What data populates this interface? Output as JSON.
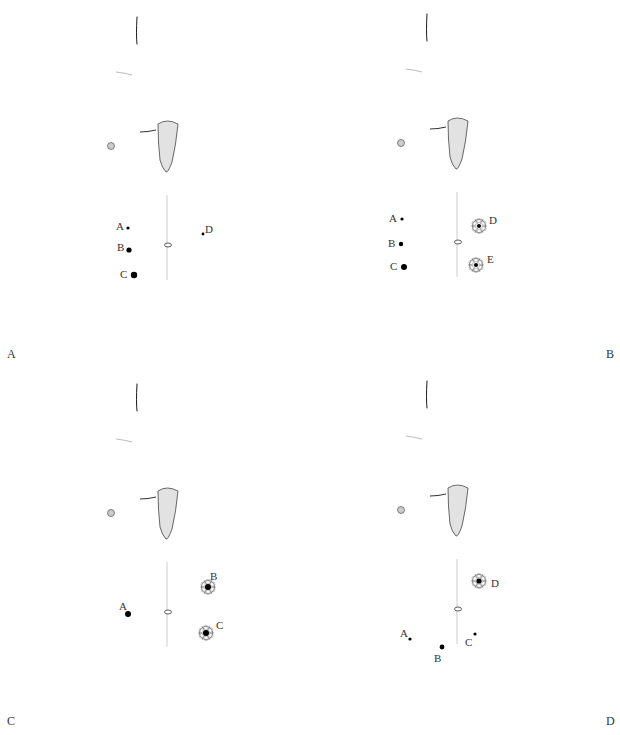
{
  "figure": {
    "panels": [
      {
        "id": "A",
        "letter": "A",
        "letter_pos": "left",
        "ports": [
          {
            "label": "A",
            "x": 128,
            "y": 228,
            "r": 1.6,
            "type": "dot",
            "label_dx": -12,
            "label_dy": -1
          },
          {
            "label": "B",
            "x": 129,
            "y": 250,
            "r": 2.6,
            "type": "dot",
            "label_dx": -12,
            "label_dy": -2
          },
          {
            "label": "C",
            "x": 134,
            "y": 275,
            "r": 3.2,
            "type": "dot",
            "label_dx": -14,
            "label_dy": 0
          },
          {
            "label": "D",
            "x": 203,
            "y": 234,
            "r": 1.4,
            "type": "dot",
            "label_dx": 2,
            "label_dy": -4
          }
        ]
      },
      {
        "id": "B",
        "letter": "B",
        "letter_pos": "right",
        "ports": [
          {
            "label": "A",
            "x": 112,
            "y": 222,
            "r": 1.6,
            "type": "dot",
            "label_dx": -13,
            "label_dy": 0
          },
          {
            "label": "B",
            "x": 111,
            "y": 247,
            "r": 2.2,
            "type": "dot",
            "label_dx": -13,
            "label_dy": 0
          },
          {
            "label": "C",
            "x": 114,
            "y": 270,
            "r": 3.0,
            "type": "dot",
            "label_dx": -14,
            "label_dy": 0
          },
          {
            "label": "D",
            "x": 189,
            "y": 229,
            "r": 2.0,
            "type": "rosette",
            "label_dx": 10,
            "label_dy": -5
          },
          {
            "label": "E",
            "x": 186,
            "y": 268,
            "r": 2.0,
            "type": "rosette",
            "label_dx": 11,
            "label_dy": -5
          }
        ]
      },
      {
        "id": "C",
        "letter": "C",
        "letter_pos": "left",
        "ports": [
          {
            "label": "A",
            "x": 128,
            "y": 247,
            "r": 3.0,
            "type": "dot",
            "label_dx": -9,
            "label_dy": -7
          },
          {
            "label": "B",
            "x": 208,
            "y": 220,
            "r": 3.0,
            "type": "rosette",
            "label_dx": 2,
            "label_dy": -10
          },
          {
            "label": "C",
            "x": 206,
            "y": 266,
            "r": 3.0,
            "type": "rosette",
            "label_dx": 10,
            "label_dy": -7
          }
        ]
      },
      {
        "id": "D",
        "letter": "D",
        "letter_pos": "right",
        "ports": [
          {
            "label": "D",
            "x": 189,
            "y": 217,
            "r": 2.6,
            "type": "rosette",
            "label_dx": 12,
            "label_dy": 3
          },
          {
            "label": "A",
            "x": 120,
            "y": 275,
            "r": 1.6,
            "type": "dot",
            "label_dx": -10,
            "label_dy": -5
          },
          {
            "label": "B",
            "x": 152,
            "y": 283,
            "r": 2.4,
            "type": "dot",
            "label_dx": -8,
            "label_dy": 12
          },
          {
            "label": "C",
            "x": 185,
            "y": 270,
            "r": 1.6,
            "type": "dot",
            "label_dx": -10,
            "label_dy": 9
          }
        ]
      }
    ]
  }
}
